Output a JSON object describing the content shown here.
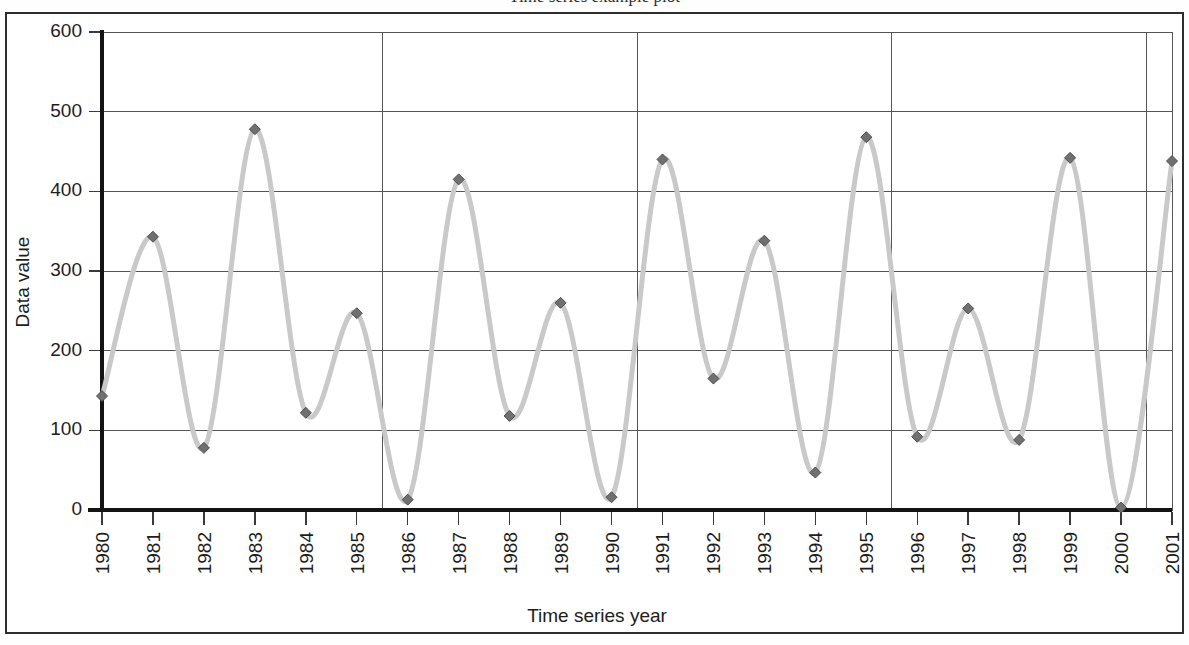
{
  "figure": {
    "title_fragment": "Time series example plot",
    "frame_border_color": "#2e2e2e",
    "background_color": "#ffffff"
  },
  "chart_data": {
    "type": "line",
    "title": "",
    "xlabel": "Time series year",
    "ylabel": "Data value",
    "categories": [
      "1980",
      "1981",
      "1982",
      "1983",
      "1984",
      "1985",
      "1986",
      "1987",
      "1988",
      "1989",
      "1990",
      "1991",
      "1992",
      "1993",
      "1994",
      "1995",
      "1996",
      "1997",
      "1998",
      "1999",
      "2000",
      "2001"
    ],
    "values": [
      143,
      343,
      78,
      478,
      122,
      247,
      13,
      415,
      118,
      260,
      16,
      440,
      165,
      338,
      47,
      468,
      92,
      253,
      88,
      442,
      3,
      438
    ],
    "series": [
      {
        "name": "Data value",
        "values": [
          143,
          343,
          78,
          478,
          122,
          247,
          13,
          415,
          118,
          260,
          16,
          440,
          165,
          338,
          47,
          468,
          92,
          253,
          88,
          442,
          3,
          438
        ]
      }
    ],
    "ylim": [
      0,
      600
    ],
    "ytick_labels": [
      "0",
      "100",
      "200",
      "300",
      "400",
      "500",
      "600"
    ],
    "ytick_values": [
      0,
      100,
      200,
      300,
      400,
      500,
      600
    ],
    "xtick_rotation": -90,
    "grid": {
      "horizontal": true,
      "vertical": true,
      "vertical_every_years": 5,
      "vertical_at_categories": [
        "1985",
        "1990",
        "1995",
        "2000"
      ],
      "color": "#555555"
    },
    "legend": {
      "visible": false,
      "position": "none"
    },
    "smoothing": "spline",
    "style": {
      "line_color": "#c9c9c9",
      "line_width": 5,
      "marker_shape": "diamond",
      "marker_color": "#707070",
      "marker_edge_color": "#4d4d4d",
      "marker_size": 8,
      "axis_color": "#141414",
      "gridline_color": "#555555",
      "tick_label_color": "#1d1d1d"
    }
  }
}
